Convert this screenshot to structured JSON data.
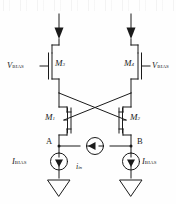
{
  "figure": {
    "type": "circuit-schematic",
    "background_color": "#fefefe",
    "line_color": "#1a1a1a"
  },
  "labels": {
    "vbias_left": {
      "symbol": "V",
      "subscript": "BIAS"
    },
    "vbias_right": {
      "symbol": "V",
      "subscript": "BIAS"
    },
    "ibias_left": {
      "symbol": "I",
      "subscript": "BIAS"
    },
    "ibias_right": {
      "symbol": "I",
      "subscript": "BIAS"
    },
    "iin": {
      "symbol": "i",
      "subscript": "in"
    },
    "node_a": "A",
    "node_b": "B"
  },
  "transistors": [
    {
      "id": "M1",
      "symbol": "M",
      "subscript": "1",
      "type": "nmos",
      "position": "left-lower"
    },
    {
      "id": "M2",
      "symbol": "M",
      "subscript": "2",
      "type": "nmos",
      "position": "right-lower"
    },
    {
      "id": "M3",
      "symbol": "M",
      "subscript": "3",
      "type": "pmos",
      "position": "left-upper"
    },
    {
      "id": "M4",
      "symbol": "M",
      "subscript": "4",
      "type": "pmos",
      "position": "right-upper"
    }
  ],
  "sources": [
    {
      "name": "ibias-left",
      "kind": "current-source",
      "arrow": "down"
    },
    {
      "name": "ibias-right",
      "kind": "current-source",
      "arrow": "down"
    },
    {
      "name": "iin-center",
      "kind": "current-source",
      "arrow": "left"
    }
  ],
  "supply_arrows": [
    {
      "name": "supply-arrow-left",
      "direction": "down"
    },
    {
      "name": "supply-arrow-right",
      "direction": "down"
    }
  ],
  "grounds": [
    {
      "name": "ground-left",
      "style": "hollow-triangle"
    },
    {
      "name": "ground-right",
      "style": "hollow-triangle"
    }
  ]
}
